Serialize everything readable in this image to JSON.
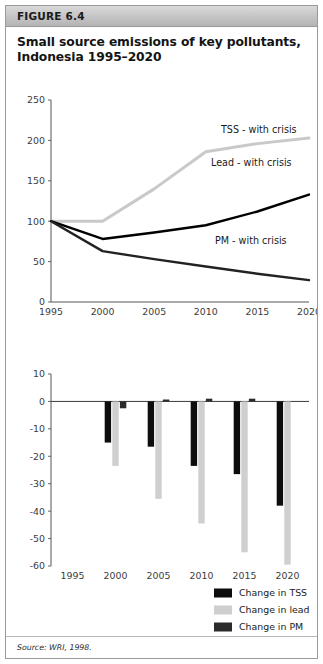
{
  "figure": {
    "number_label": "FIGURE 6.4",
    "title": "Small source emissions of key pollutants, Indonesia 1995–2020",
    "source": "Source: WRI, 1998."
  },
  "colors": {
    "header_bg": "#c4c4c4",
    "border": "#9a9a9a",
    "series_tss_line": "#c9c9c9",
    "series_lead_line": "#000000",
    "series_pm_line": "#222222",
    "bar_tss": "#0d0d0d",
    "bar_lead": "#cfcfcf",
    "bar_pm": "#2b2b2b",
    "axis": "#555555",
    "text": "#1a1a1a"
  },
  "chart_data": [
    {
      "type": "line",
      "title": "Small source emissions of key pollutants, Indonesia 1995–2020",
      "xlabel": "",
      "ylabel": "",
      "x": [
        1995,
        2000,
        2005,
        2010,
        2015,
        2020
      ],
      "xtick_labels": [
        "1995",
        "2000",
        "2005",
        "2010",
        "2015",
        "2020"
      ],
      "ytick_labels": [
        "0",
        "50",
        "100",
        "150",
        "200",
        "250"
      ],
      "yticks": [
        0,
        50,
        100,
        150,
        200,
        250
      ],
      "ylim": [
        0,
        250
      ],
      "xlim": [
        1995,
        2020
      ],
      "grid": false,
      "legend_position": "inline-annotation",
      "series": [
        {
          "name": "TSS - with crisis",
          "color": "#c9c9c9",
          "values": [
            100,
            100,
            140,
            186,
            196,
            203
          ],
          "label_text": "TSS - with crisis"
        },
        {
          "name": "Lead - with crisis",
          "color": "#000000",
          "values": [
            100,
            78,
            86,
            95,
            112,
            133
          ],
          "label_text": "Lead - with crisis"
        },
        {
          "name": "PM - with crisis",
          "color": "#222222",
          "values": [
            100,
            63,
            53,
            44,
            35,
            27
          ],
          "label_text": "PM - with crisis"
        }
      ]
    },
    {
      "type": "bar",
      "title": "",
      "xlabel": "",
      "ylabel": "",
      "categories": [
        "1995",
        "2000",
        "2005",
        "2010",
        "2015",
        "2020"
      ],
      "ytick_labels": [
        "10",
        "0",
        "-10",
        "-20",
        "-30",
        "-40",
        "-50",
        "-60"
      ],
      "yticks": [
        10,
        0,
        -10,
        -20,
        -30,
        -40,
        -50,
        -60
      ],
      "ylim": [
        -60,
        10
      ],
      "grid": false,
      "legend_position": "bottom-right",
      "series": [
        {
          "name": "Change in TSS",
          "color": "#0d0d0d",
          "values": [
            0,
            -15,
            -16.5,
            -23.5,
            -26.5,
            -38
          ]
        },
        {
          "name": "Change in lead",
          "color": "#cfcfcf",
          "values": [
            0,
            -23.5,
            -35.5,
            -44.5,
            -55,
            -59.5
          ]
        },
        {
          "name": "Change in PM",
          "color": "#2b2b2b",
          "values": [
            0,
            -2.5,
            0.7,
            1.0,
            1.0,
            0
          ]
        }
      ]
    }
  ],
  "legend": {
    "items": [
      {
        "label": "Change in TSS",
        "color": "#0d0d0d"
      },
      {
        "label": "Change in lead",
        "color": "#cfcfcf"
      },
      {
        "label": "Change in PM",
        "color": "#2b2b2b"
      }
    ]
  }
}
